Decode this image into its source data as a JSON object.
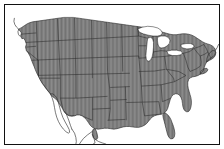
{
  "figure": {
    "type": "choropleth-map",
    "title": "Map of the contiguous United States",
    "background_color": "#ffffff",
    "frame": {
      "visible": true,
      "color": "#111111",
      "thickness_px": 1,
      "inset_px": 4
    }
  },
  "map": {
    "projection": "conic",
    "region": "United States (contiguous 48)",
    "land_fill_color": "#8c8c8c",
    "hatch_color": "#6e6e6e",
    "hatch_style": "vertical-lines",
    "hatch_spacing_px": 1.4,
    "state_border_color": "#2a2a2a",
    "state_border_width_px": 0.6,
    "coastline_color": "#2a2a2a",
    "coastline_width_px": 0.8,
    "water_fill_color": "#ffffff",
    "neighbor_fill_color": "#ffffff",
    "shaded_region_count": 48,
    "legend": {
      "visible": false
    },
    "labels": {
      "visible": false
    },
    "features": [
      {
        "name": "contiguous-united-states",
        "shaded": true
      },
      {
        "name": "great-lakes",
        "shaded": false
      },
      {
        "name": "mexico",
        "shaded": false
      },
      {
        "name": "canada",
        "shaded": false
      },
      {
        "name": "baja-california",
        "shaded": false
      },
      {
        "name": "atlantic-ocean",
        "shaded": false
      },
      {
        "name": "pacific-ocean",
        "shaded": false
      },
      {
        "name": "gulf-of-mexico",
        "shaded": false
      }
    ]
  }
}
